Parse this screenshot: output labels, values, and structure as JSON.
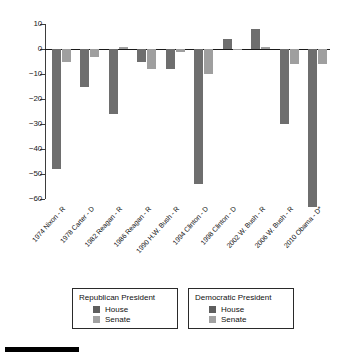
{
  "chart_data": {
    "type": "bar",
    "title": "",
    "subtitle": "",
    "xlabel": "",
    "ylabel": "",
    "ylim": [
      -60,
      10
    ],
    "yticks": [
      10,
      0,
      -10,
      -20,
      -30,
      -40,
      -50,
      -60
    ],
    "ytick_labels": [
      "10",
      "0",
      "−10",
      "−20",
      "−30",
      "−40",
      "−50",
      "−60"
    ],
    "grid": false,
    "legend_position": "below-axis",
    "categories": [
      "1974 Nixon - R",
      "1978 Carter - D",
      "1982 Reagan - R",
      "1986 Reagan - R",
      "1990 H.W. Bush - R",
      "1994 Clinton - D",
      "1998 Clinton - D",
      "2002 W. Bush - R",
      "2006 W. Bush - R",
      "2010 Obama - D*"
    ],
    "category_party": [
      "R",
      "D",
      "R",
      "R",
      "R",
      "D",
      "D",
      "R",
      "R",
      "D"
    ],
    "series": [
      {
        "name": "House",
        "color": "#6e6e6e",
        "values": [
          -48,
          -15,
          -26,
          -5,
          -8,
          -54,
          4,
          8,
          -30,
          -63
        ]
      },
      {
        "name": "Senate",
        "color": "#9f9f9f",
        "values": [
          -5,
          -3,
          1,
          -8,
          -1,
          -10,
          0,
          1,
          -6,
          -6
        ]
      }
    ],
    "annotations": []
  },
  "legend": {
    "groups": [
      {
        "title": "Republican President",
        "entries": [
          {
            "label": "House",
            "swatch": "house"
          },
          {
            "label": "Senate",
            "swatch": "senate"
          }
        ]
      },
      {
        "title": "Democratic President",
        "entries": [
          {
            "label": "House",
            "swatch": "house"
          },
          {
            "label": "Senate",
            "swatch": "senate"
          }
        ]
      }
    ]
  },
  "colors": {
    "house": "#6e6e6e",
    "senate": "#9f9f9f",
    "axis": "#1a1a1a",
    "background": "#ffffff",
    "rule": "#000000"
  }
}
